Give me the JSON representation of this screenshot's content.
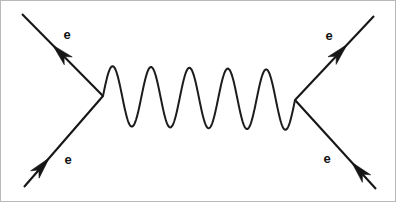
{
  "diagram": {
    "type": "feynman-diagram",
    "background_color": "#ffffff",
    "line_color": "#161616",
    "border_color": "#b9b9b9",
    "canvas": {
      "width": 396,
      "height": 202
    },
    "vertices": [
      {
        "id": "left-vertex",
        "x": 103,
        "y": 96
      },
      {
        "id": "right-vertex",
        "x": 295,
        "y": 100
      }
    ],
    "propagator": {
      "name": "photon",
      "style": "wavy",
      "x_start": 103,
      "x_end": 295,
      "center_y": 98,
      "amplitude": 30,
      "cycles": 5
    },
    "legs": [
      {
        "id": "outgoing-top-left",
        "label": "e",
        "label_x": 67,
        "label_y": 36,
        "from_x": 103,
        "from_y": 96,
        "to_x": 22,
        "to_y": 14,
        "arrow_direction": "outgoing",
        "arrow_t": 0.62
      },
      {
        "id": "outgoing-top-right",
        "label": "e",
        "label_x": 329,
        "label_y": 37,
        "from_x": 295,
        "from_y": 100,
        "to_x": 374,
        "to_y": 16,
        "arrow_direction": "outgoing",
        "arrow_t": 0.66
      },
      {
        "id": "incoming-bottom-left",
        "label": "e",
        "label_x": 68,
        "label_y": 161,
        "from_x": 24,
        "from_y": 187,
        "to_x": 103,
        "to_y": 96,
        "arrow_direction": "incoming",
        "arrow_t": 0.32
      },
      {
        "id": "incoming-bottom-right",
        "label": "e",
        "label_x": 327,
        "label_y": 160,
        "from_x": 376,
        "from_y": 189,
        "to_x": 295,
        "to_y": 100,
        "arrow_direction": "incoming",
        "arrow_t": 0.3
      }
    ],
    "labels": [
      "e",
      "e",
      "e",
      "e"
    ]
  }
}
